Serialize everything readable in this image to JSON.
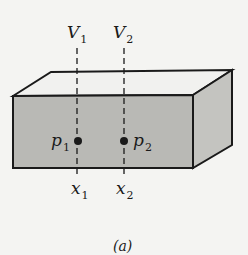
{
  "figure": {
    "caption": "(a)",
    "labels": {
      "V1": {
        "main": "V",
        "sub": "1"
      },
      "V2": {
        "main": "V",
        "sub": "2"
      },
      "p1": {
        "main": "p",
        "sub": "1"
      },
      "p2": {
        "main": "p",
        "sub": "2"
      },
      "x1": {
        "main": "x",
        "sub": "1"
      },
      "x2": {
        "main": "x",
        "sub": "2"
      }
    },
    "colors": {
      "front_face": "#b9b9b5",
      "side_face": "#c4c4c0",
      "top_face": "#f1f1ef",
      "stroke": "#1a1a1a"
    }
  }
}
